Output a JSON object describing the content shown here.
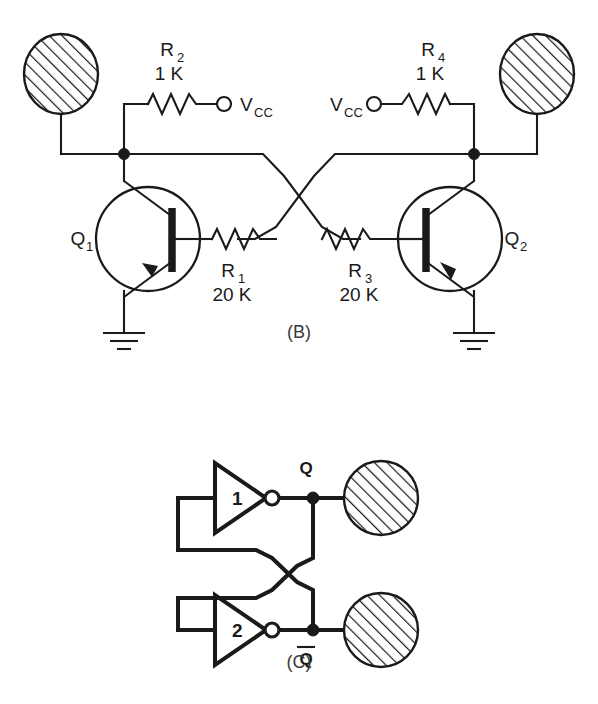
{
  "figure": {
    "panels": [
      {
        "id": "B",
        "caption": "(B)",
        "type": "transistor-bistable-multivibrator",
        "components": [
          {
            "ref": "R1",
            "ref_base": "R",
            "ref_sub": "1",
            "value": "20 K",
            "kind": "resistor"
          },
          {
            "ref": "R2",
            "ref_base": "R",
            "ref_sub": "2",
            "value": "1 K",
            "kind": "resistor"
          },
          {
            "ref": "R3",
            "ref_base": "R",
            "ref_sub": "3",
            "value": "20 K",
            "kind": "resistor"
          },
          {
            "ref": "R4",
            "ref_base": "R",
            "ref_sub": "4",
            "value": "1 K",
            "kind": "resistor"
          },
          {
            "ref": "Q1",
            "ref_base": "Q",
            "ref_sub": "1",
            "value": "",
            "kind": "npn-transistor"
          },
          {
            "ref": "Q2",
            "ref_base": "Q",
            "ref_sub": "2",
            "value": "",
            "kind": "npn-transistor"
          }
        ],
        "supplies": [
          {
            "label_base": "V",
            "label_sub": "CC",
            "side": "left"
          },
          {
            "label_base": "V",
            "label_sub": "CC",
            "side": "right"
          }
        ],
        "grounds": 2,
        "output_blobs": 2
      },
      {
        "id": "C",
        "caption": "(C)",
        "type": "cross-coupled-inverter-latch",
        "gates": [
          {
            "label": "1",
            "kind": "inverter"
          },
          {
            "label": "2",
            "kind": "inverter"
          }
        ],
        "nodes": [
          {
            "label": "Q",
            "overbar": false
          },
          {
            "label": "Q",
            "overbar": true
          }
        ],
        "output_blobs": 2
      }
    ]
  },
  "colors": {
    "ink": "#1a1a1a",
    "paper": "#ffffff",
    "caption_ink": "#3a3a3a"
  }
}
